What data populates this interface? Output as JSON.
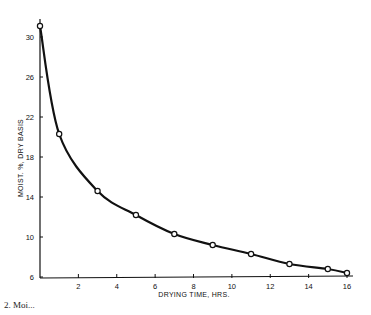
{
  "chart_data": {
    "type": "line",
    "title": "",
    "xlabel": "DRYING TIME, HRS.",
    "ylabel": "MOIST. %, DRY BASIS",
    "xlim": [
      0,
      16
    ],
    "ylim": [
      6,
      31.5
    ],
    "x_ticks": [
      2,
      4,
      6,
      8,
      10,
      12,
      14,
      16
    ],
    "y_ticks": [
      6,
      10,
      14,
      18,
      22,
      26,
      30
    ],
    "grid": false,
    "legend": null,
    "series": [
      {
        "name": "Moisture content",
        "marker": "open-circle",
        "x": [
          0,
          1,
          3,
          5,
          7,
          9,
          11,
          13,
          15,
          16
        ],
        "values": [
          31.1,
          20.3,
          14.6,
          12.2,
          10.3,
          9.2,
          8.3,
          7.3,
          6.8,
          6.4
        ]
      }
    ]
  },
  "caption": "2. Moi..."
}
